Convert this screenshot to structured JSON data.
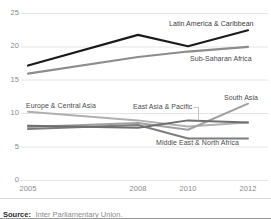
{
  "chart_data": {
    "type": "line",
    "title": "",
    "xlabel": "",
    "ylabel": "",
    "x": [
      2005,
      2008,
      2010,
      2012
    ],
    "categories": [
      "2005",
      "2008",
      "2010",
      "2012"
    ],
    "ylim": [
      0,
      25
    ],
    "yticks": [
      0,
      5,
      10,
      15,
      20,
      25
    ],
    "ytick_labels": [
      "0",
      "5",
      "10",
      "15",
      "20",
      "25"
    ],
    "xtick_labels": [
      "2005",
      "2008",
      "2010",
      "2012"
    ],
    "grid": "horizontal",
    "legend_position": "inline-labels",
    "series": [
      {
        "name": "Latin America & Caribbean",
        "values": [
          17.2,
          21.8,
          20.1,
          22.5
        ],
        "color": "#1a1a1a",
        "width": 2.1
      },
      {
        "name": "Sub-Saharan Africa",
        "values": [
          16.0,
          18.5,
          19.3,
          20.0
        ],
        "color": "#8c8c8c",
        "width": 2.1
      },
      {
        "name": "South Asia",
        "values": [
          8.0,
          8.6,
          7.6,
          11.5
        ],
        "color": "#a0a0a0",
        "width": 2.0
      },
      {
        "name": "East Asia & Pacific",
        "values": [
          8.2,
          7.9,
          9.0,
          8.7
        ],
        "color": "#6e6e6e",
        "width": 2.0
      },
      {
        "name": "Europe & Central Asia",
        "values": [
          10.3,
          9.0,
          8.1,
          8.7
        ],
        "color": "#b0b0b0",
        "width": 2.0
      },
      {
        "name": "Middle East & North Africa",
        "values": [
          7.7,
          8.3,
          6.3,
          6.3
        ],
        "color": "#7d7d7d",
        "width": 2.0
      }
    ],
    "annotations": [
      {
        "name": "Latin America & Caribbean",
        "text": "Latin America & Caribbean"
      },
      {
        "name": "Sub-Saharan Africa",
        "text": "Sub-Saharan Africa"
      },
      {
        "name": "South Asia",
        "text": "South Asia"
      },
      {
        "name": "East Asia & Pacific",
        "text": "East Asia & Pacific"
      },
      {
        "name": "Europe & Central Asia",
        "text": "Europe & Central Asia"
      },
      {
        "name": "Middle East & North Africa",
        "text": "Middle East & North Africa"
      }
    ]
  },
  "footer": {
    "source_label": "Source:",
    "source_text": "Inter Parliamentary Union."
  },
  "colors": {
    "grid": "#e2e2e2",
    "tick_text": "#8a8a8a",
    "label_text": "#4a4a4a",
    "dark_series": "#1a1a1a"
  }
}
